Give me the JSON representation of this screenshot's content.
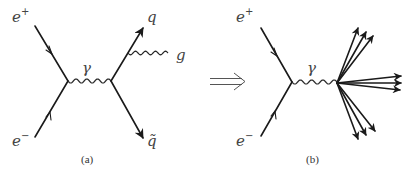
{
  "figure": {
    "panels": [
      {
        "id": "a",
        "caption": "(a)",
        "labels": {
          "positron": "e",
          "positron_charge": "+",
          "electron": "e",
          "electron_charge": "−",
          "photon": "γ",
          "quark": "q",
          "antiquark": "q̃",
          "gluon": "g"
        },
        "particles": [
          "e+",
          "e-",
          "photon",
          "quark",
          "antiquark",
          "gluon"
        ]
      },
      {
        "id": "b",
        "caption": "(b)",
        "labels": {
          "positron": "e",
          "positron_charge": "+",
          "electron": "e",
          "electron_charge": "−",
          "photon": "γ"
        },
        "jets": [
          {
            "name": "upper-jet",
            "tracks": 3
          },
          {
            "name": "middle-jet",
            "tracks": 3
          },
          {
            "name": "lower-jet",
            "tracks": 3
          }
        ]
      }
    ],
    "transition_symbol": "⇒"
  }
}
